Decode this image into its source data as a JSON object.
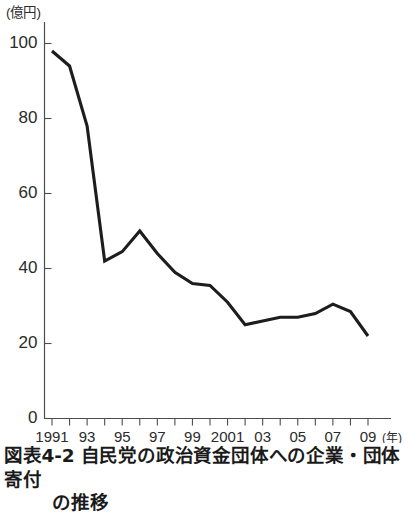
{
  "figure": {
    "caption_line_1": "図表4-2 自民党の政治資金団体への企業・団体寄付",
    "caption_line_2": "の推移",
    "y_unit": "(億円)",
    "x_unit": "(年)"
  },
  "chart_data": {
    "type": "line",
    "xlabel": "(年)",
    "ylabel": "(億円)",
    "ylim": [
      0,
      100
    ],
    "xlim": [
      1991,
      2009
    ],
    "grid": false,
    "legend": "none",
    "y_ticks": [
      0,
      20,
      40,
      60,
      80,
      100
    ],
    "y_tick_labels": [
      "0",
      "20",
      "40",
      "60",
      "80",
      "100"
    ],
    "x_ticks": [
      1991,
      1992,
      1993,
      1994,
      1995,
      1996,
      1997,
      1998,
      1999,
      2000,
      2001,
      2002,
      2003,
      2004,
      2005,
      2006,
      2007,
      2008,
      2009
    ],
    "x_tick_labels": [
      "1991",
      "",
      "93",
      "",
      "95",
      "",
      "97",
      "",
      "99",
      "",
      "2001",
      "",
      "03",
      "",
      "05",
      "",
      "07",
      "",
      "09"
    ],
    "x": [
      1991,
      1992,
      1993,
      1994,
      1995,
      1996,
      1997,
      1998,
      1999,
      2000,
      2001,
      2002,
      2003,
      2004,
      2005,
      2006,
      2007,
      2008,
      2009
    ],
    "values": [
      98,
      94,
      78,
      42,
      44.5,
      50,
      44,
      39,
      36,
      35.5,
      31,
      25,
      26,
      27,
      27,
      28,
      30.5,
      28.5,
      22
    ],
    "series_name": "自民党の政治資金団体への企業・団体寄付",
    "line_color": "#1d1d1d",
    "axis_color": "#4d4d4d"
  }
}
